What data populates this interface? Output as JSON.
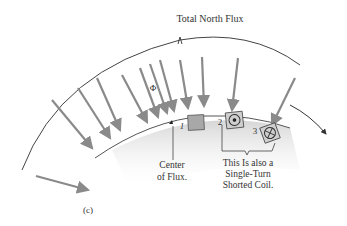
{
  "diagram": {
    "title": "Total North Flux",
    "flux_symbol": "Φ",
    "markers": {
      "one": "1",
      "two": "2",
      "three": "3"
    },
    "center_label_line1": "Center",
    "center_label_line2": "of Flux.",
    "coil_label_line1": "This Is also a",
    "coil_label_line2": "Single-Turn",
    "coil_label_line3": "Shorted Coil.",
    "figure_label": "(c)",
    "colors": {
      "arrow": "#8a8a8a",
      "shading": "#d9d9d9",
      "line": "#444444",
      "slot_fill": "#a8a8a8"
    }
  }
}
